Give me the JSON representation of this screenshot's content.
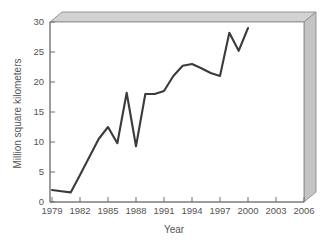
{
  "chart_data": {
    "type": "line",
    "title": "",
    "xlabel": "Year",
    "ylabel": "Million square kilometers",
    "xlim": [
      1979,
      2006
    ],
    "ylim": [
      0,
      30
    ],
    "xticks": [
      "1979",
      "1982",
      "1985",
      "1988",
      "1991",
      "1994",
      "1997",
      "2000",
      "2003",
      "2006"
    ],
    "yticks": [
      "0",
      "5",
      "10",
      "15",
      "20",
      "25",
      "30"
    ],
    "grid": false,
    "legend": "none",
    "series": [
      {
        "name": "Ozone hole area",
        "color": "#3b3b3b",
        "x": [
          1979,
          1980,
          1981,
          1982,
          1983,
          1984,
          1985,
          1986,
          1987,
          1988,
          1989,
          1990,
          1991,
          1992,
          1993,
          1994,
          1995,
          1996,
          1997,
          1998,
          1999,
          2000
        ],
        "values": [
          2.0,
          1.8,
          1.6,
          4.5,
          7.5,
          10.5,
          12.5,
          9.8,
          18.2,
          9.3,
          18.0,
          18.0,
          18.5,
          21.0,
          22.7,
          23.0,
          22.3,
          21.5,
          21.0,
          28.2,
          25.2,
          29.0
        ]
      }
    ]
  },
  "axis": {
    "y_title": "Million square kilometers",
    "x_title": "Year",
    "y_ticks": [
      "30",
      "25",
      "20",
      "15",
      "10",
      "5",
      "0"
    ],
    "x_ticks": [
      "1979",
      "1982",
      "1985",
      "1988",
      "1991",
      "1994",
      "1997",
      "2000",
      "2003",
      "2006"
    ]
  },
  "style": {
    "frame_face": "#cfcfcf",
    "frame_edge": "#8d8d8d",
    "plot_bg": "#ffffff",
    "line_color": "#3b3b3b",
    "text_color": "#545454"
  }
}
